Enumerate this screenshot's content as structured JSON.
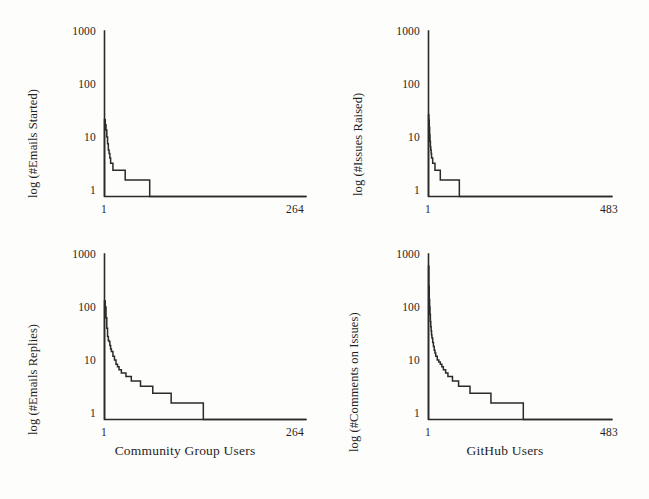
{
  "figure": {
    "background_color": "#fdfdfb",
    "ink_color": "#2a2a2a",
    "layout": "2x2 grid of log-scale rank-frequency plots"
  },
  "panels": [
    {
      "id": "top-left",
      "ylabel": "log (#Emails Started)",
      "yticks": [
        "1",
        "10",
        "100",
        "1000"
      ],
      "xticks": [
        "1",
        "264"
      ],
      "xaxis_title": ""
    },
    {
      "id": "top-right",
      "ylabel": "log (#Issues Raised)",
      "yticks": [
        "1",
        "10",
        "100",
        "1000"
      ],
      "xticks": [
        "1",
        "483"
      ],
      "xaxis_title": ""
    },
    {
      "id": "bottom-left",
      "ylabel": "log (#Emails Replies)",
      "yticks": [
        "1",
        "10",
        "100",
        "1000"
      ],
      "xticks": [
        "1",
        "264"
      ],
      "xaxis_title": "Community Group Users"
    },
    {
      "id": "bottom-right",
      "ylabel": "log (#Comments on Issues)",
      "yticks": [
        "1",
        "10",
        "100",
        "1000"
      ],
      "xticks": [
        "1",
        "483"
      ],
      "xaxis_title": "GitHub Users"
    }
  ],
  "chart_data": [
    {
      "type": "line",
      "panel": "top-left",
      "title": "",
      "xlabel": "",
      "ylabel": "log (#Emails Started)",
      "yscale": "log",
      "ylim": [
        1,
        1000
      ],
      "ytick_values": [
        1,
        10,
        100,
        1000
      ],
      "xlim": [
        1,
        264
      ],
      "xtick_values": [
        1,
        264
      ],
      "grid": false,
      "legend": null,
      "description": "Rank-frequency step curve: number of emails started per community group user, sorted descending.",
      "x": [
        1,
        2,
        3,
        4,
        5,
        6,
        7,
        8,
        9,
        10,
        12,
        14,
        16,
        18,
        20,
        24,
        28,
        32,
        36,
        40,
        44,
        48,
        52,
        56,
        60,
        264
      ],
      "y": [
        25,
        20,
        16,
        12,
        9,
        7,
        6,
        5,
        4,
        4,
        3,
        3,
        3,
        3,
        3,
        3,
        2,
        2,
        2,
        2,
        2,
        2,
        2,
        2,
        1,
        1
      ]
    },
    {
      "type": "line",
      "panel": "top-right",
      "title": "",
      "xlabel": "",
      "ylabel": "log (#Issues Raised)",
      "yscale": "log",
      "ylim": [
        1,
        1000
      ],
      "ytick_values": [
        1,
        10,
        100,
        1000
      ],
      "xlim": [
        1,
        483
      ],
      "xtick_values": [
        1,
        483
      ],
      "grid": false,
      "legend": null,
      "description": "Rank-frequency step curve: number of issues raised per GitHub user, sorted descending.",
      "x": [
        1,
        2,
        3,
        4,
        5,
        6,
        7,
        8,
        9,
        10,
        12,
        14,
        16,
        18,
        20,
        24,
        28,
        32,
        36,
        40,
        46,
        52,
        58,
        64,
        70,
        76,
        82,
        483
      ],
      "y": [
        30,
        24,
        18,
        13,
        10,
        8,
        7,
        6,
        5,
        5,
        4,
        4,
        4,
        3,
        3,
        3,
        3,
        2,
        2,
        2,
        2,
        2,
        2,
        2,
        2,
        2,
        1,
        1
      ]
    },
    {
      "type": "line",
      "panel": "bottom-left",
      "title": "",
      "xlabel": "Community Group Users",
      "ylabel": "log (#Emails Replies)",
      "yscale": "log",
      "ylim": [
        1,
        1000
      ],
      "ytick_values": [
        1,
        10,
        100,
        1000
      ],
      "xlim": [
        1,
        264
      ],
      "xtick_values": [
        1,
        264
      ],
      "grid": false,
      "legend": null,
      "description": "Rank-frequency step curve: number of email replies per community group user, sorted descending.",
      "x": [
        1,
        2,
        3,
        4,
        5,
        6,
        7,
        8,
        9,
        10,
        12,
        14,
        16,
        18,
        20,
        23,
        26,
        29,
        32,
        36,
        40,
        44,
        48,
        52,
        56,
        60,
        64,
        70,
        76,
        82,
        88,
        94,
        100,
        110,
        120,
        130,
        264
      ],
      "y": [
        140,
        110,
        70,
        45,
        32,
        27,
        26,
        22,
        19,
        17,
        14,
        12,
        10,
        9,
        8,
        7,
        7,
        6,
        6,
        5,
        5,
        5,
        4,
        4,
        4,
        4,
        3,
        3,
        3,
        3,
        2,
        2,
        2,
        2,
        2,
        1,
        1
      ]
    },
    {
      "type": "line",
      "panel": "bottom-right",
      "title": "",
      "xlabel": "GitHub Users",
      "ylabel": "log (#Comments on Issues)",
      "yscale": "log",
      "ylim": [
        1,
        1000
      ],
      "ytick_values": [
        1,
        10,
        100,
        1000
      ],
      "xlim": [
        1,
        483
      ],
      "xtick_values": [
        1,
        483
      ],
      "grid": false,
      "legend": null,
      "description": "Rank-frequency step curve: number of comments on issues per GitHub user, sorted descending.",
      "x": [
        1,
        2,
        3,
        4,
        5,
        6,
        7,
        8,
        9,
        10,
        12,
        14,
        16,
        18,
        20,
        24,
        28,
        32,
        36,
        40,
        46,
        52,
        58,
        64,
        70,
        80,
        90,
        100,
        110,
        120,
        130,
        140,
        150,
        165,
        180,
        195,
        210,
        230,
        250,
        483
      ],
      "y": [
        600,
        260,
        150,
        110,
        80,
        60,
        48,
        40,
        34,
        30,
        25,
        21,
        18,
        16,
        14,
        12,
        11,
        10,
        9,
        8,
        7,
        6,
        6,
        5,
        5,
        4,
        4,
        4,
        3,
        3,
        3,
        3,
        3,
        2,
        2,
        2,
        2,
        2,
        1,
        1
      ]
    }
  ]
}
